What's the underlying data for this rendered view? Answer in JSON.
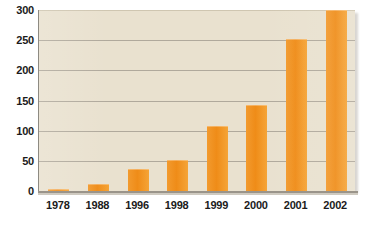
{
  "chart_data": {
    "type": "bar",
    "title": "",
    "subtitle": "",
    "xlabel": "",
    "ylabel": "",
    "categories": [
      "1978",
      "1988",
      "1996",
      "1998",
      "1999",
      "2000",
      "2001",
      "2002"
    ],
    "values": [
      4,
      11,
      37,
      52,
      108,
      142,
      252,
      300
    ],
    "series": [
      {
        "name": "",
        "values": [
          4,
          11,
          37,
          52,
          108,
          142,
          252,
          300
        ]
      }
    ],
    "ylim": [
      0,
      300
    ],
    "yticks": [
      0,
      50,
      100,
      150,
      200,
      250,
      300
    ],
    "ytick_labels": [
      "0",
      "50",
      "100",
      "150",
      "200",
      "250",
      "300"
    ],
    "grid": true,
    "grid_axis": "y",
    "legend": false,
    "legend_position": "none",
    "annotations": [],
    "colors": {
      "bar": "#ef8c18",
      "bar_highlight": "#f5a437",
      "plot_background": "#e9e1cf",
      "gridline": "#9c968b",
      "axis_line": "#9a948a",
      "tick_label": "#1b1b1b",
      "page_background": "#ffffff",
      "panel_shadow": "#b9b5ae"
    }
  }
}
